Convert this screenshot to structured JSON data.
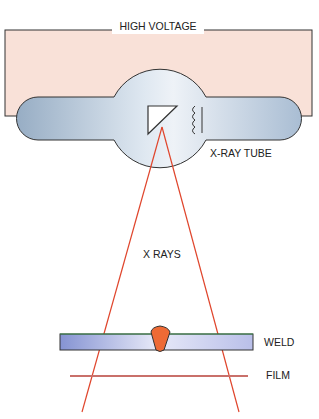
{
  "diagram": {
    "type": "radiography-schematic",
    "labels": {
      "high_voltage": "HIGH VOLTAGE",
      "xray_tube": "X-RAY TUBE",
      "x_rays": "X RAYS",
      "weld": "WELD",
      "film": "FILM"
    },
    "components": [
      {
        "id": "high-voltage-circuit",
        "label": "HIGH VOLTAGE"
      },
      {
        "id": "xray-tube",
        "label": "X-RAY TUBE",
        "parts": [
          "anode-target",
          "cathode-filament"
        ]
      },
      {
        "id": "xray-beam",
        "label": "X RAYS"
      },
      {
        "id": "weld-specimen",
        "label": "WELD"
      },
      {
        "id": "film",
        "label": "FILM"
      }
    ],
    "colors": {
      "circuit_fill": "#f9e1d8",
      "outline": "#333333",
      "tube_fill_dark": "#9fb4c9",
      "tube_fill_light": "#e8eef5",
      "ray": "#e0452c",
      "plate_dark": "#8f9cd8",
      "plate_light": "#e6e8f7",
      "plate_top": "#3a8a4a",
      "weld_bead": "#ee6a35",
      "film": "#c9706a"
    }
  }
}
